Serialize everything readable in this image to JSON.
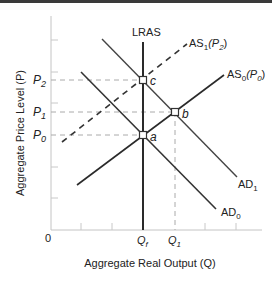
{
  "diagram": {
    "title": "",
    "x_axis": {
      "label": "Aggregate Real Output (Q)",
      "origin_label": "0",
      "ticks": [
        "Qf",
        "Q1"
      ]
    },
    "y_axis": {
      "label": "Aggregate Price Level (P)",
      "ticks": [
        "P2",
        "P1",
        "P0"
      ]
    },
    "curves": [
      {
        "id": "LRAS",
        "label": "LRAS",
        "style": "solid",
        "kind": "vertical"
      },
      {
        "id": "AS0",
        "label_main": "AS",
        "label_sub": "0",
        "label_paren": "(P",
        "label_paren_sub": "0",
        "label_close": ")",
        "style": "solid"
      },
      {
        "id": "AS1",
        "label_main": "AS",
        "label_sub": "1",
        "label_paren": "(P",
        "label_paren_sub": "2",
        "label_close": ")",
        "style": "dashed"
      },
      {
        "id": "AD0",
        "label_main": "AD",
        "label_sub": "0",
        "style": "solid"
      },
      {
        "id": "AD1",
        "label_main": "AD",
        "label_sub": "1",
        "style": "solid"
      }
    ],
    "points": [
      {
        "id": "a",
        "label": "a",
        "price": "P0",
        "output": "Qf"
      },
      {
        "id": "b",
        "label": "b",
        "price": "P1",
        "output": "Q1"
      },
      {
        "id": "c",
        "label": "c",
        "price": "P2",
        "output": "Qf"
      }
    ],
    "labels": {
      "P2_main": "P",
      "P2_sub": "2",
      "P1_main": "P",
      "P1_sub": "1",
      "P0_main": "P",
      "P0_sub": "0",
      "Qf_main": "Q",
      "Qf_sub": "f",
      "Q1_main": "Q",
      "Q1_sub": "1"
    },
    "colors": {
      "line": "#333333",
      "axis": "#bbbbbb",
      "guide": "#aaaaaa",
      "top_bar": "#3a3a3a"
    }
  }
}
